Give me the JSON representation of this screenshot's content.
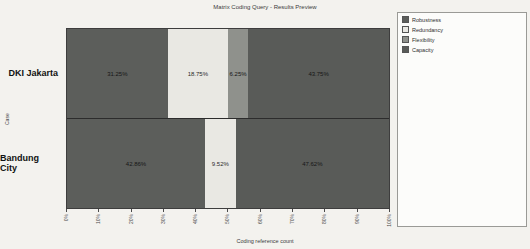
{
  "title": "Matrix Coding Query - Results Preview",
  "axes": {
    "x_label": "Coding reference count",
    "y_label": "Case",
    "x_ticks": [
      "0%",
      "10%",
      "20%",
      "30%",
      "40%",
      "50%",
      "60%",
      "70%",
      "80%",
      "90%",
      "100%"
    ]
  },
  "legend": {
    "items": [
      {
        "label": "Robustness",
        "color": "#5c5e5b"
      },
      {
        "label": "Redundancy",
        "color": "#e9e8e3"
      },
      {
        "label": "Flexibility",
        "color": "#8f918c"
      },
      {
        "label": "Capacity",
        "color": "#595b58"
      }
    ]
  },
  "rows": [
    {
      "label": "DKI Jakarta",
      "segments": [
        {
          "series": "Robustness",
          "value": "31.25%",
          "pct": 31.25,
          "color": "#5c5e5b",
          "text_color": "#161616"
        },
        {
          "series": "Redundancy",
          "value": "18.75%",
          "pct": 18.75,
          "color": "#e9e8e3",
          "text_color": "#2a2a2a"
        },
        {
          "series": "Flexibility",
          "value": "6.25%",
          "pct": 6.25,
          "color": "#8f918c",
          "text_color": "#161616"
        },
        {
          "series": "Capacity",
          "value": "43.75%",
          "pct": 43.75,
          "color": "#595b58",
          "text_color": "#161616"
        }
      ]
    },
    {
      "label": "Bandung City",
      "segments": [
        {
          "series": "Robustness",
          "value": "42.86%",
          "pct": 42.86,
          "color": "#5c5e5b",
          "text_color": "#161616"
        },
        {
          "series": "Redundancy",
          "value": "9.52%",
          "pct": 9.52,
          "color": "#e9e8e3",
          "text_color": "#2a2a2a"
        },
        {
          "series": "Capacity",
          "value": "47.62%",
          "pct": 47.62,
          "color": "#595b58",
          "text_color": "#161616"
        }
      ]
    }
  ],
  "chart_data": {
    "type": "bar",
    "subtype": "horizontal-100pct-stacked",
    "title": "Matrix Coding Query - Results Preview",
    "xlabel": "Coding reference count",
    "ylabel": "Case",
    "categories": [
      "DKI Jakarta",
      "Bandung City"
    ],
    "series": [
      {
        "name": "Robustness",
        "values": [
          31.25,
          42.86
        ]
      },
      {
        "name": "Redundancy",
        "values": [
          18.75,
          9.52
        ]
      },
      {
        "name": "Flexibility",
        "values": [
          6.25,
          0
        ]
      },
      {
        "name": "Capacity",
        "values": [
          43.75,
          47.62
        ]
      }
    ],
    "xlim": [
      0,
      100
    ],
    "x_tick_labels": [
      "0%",
      "10%",
      "20%",
      "30%",
      "40%",
      "50%",
      "60%",
      "70%",
      "80%",
      "90%",
      "100%"
    ],
    "grid": false,
    "legend_position": "right"
  }
}
